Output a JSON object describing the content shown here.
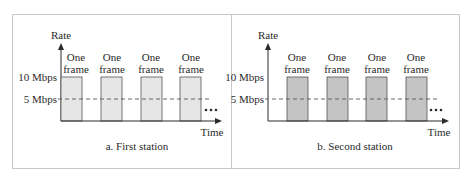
{
  "panels": [
    {
      "id": "first",
      "caption": "a. First station",
      "y_axis_label": "Rate",
      "x_axis_label": "Time",
      "levels": [
        {
          "label": "10 Mbps",
          "value": 10
        },
        {
          "label": "5 Mbps",
          "value": 5
        }
      ],
      "frame_label_line1": "One",
      "frame_label_line2": "frame",
      "frames": 4,
      "bar_fill": "#e6e6e6",
      "continuation": "•••"
    },
    {
      "id": "second",
      "caption": "b. Second station",
      "y_axis_label": "Rate",
      "x_axis_label": "Time",
      "levels": [
        {
          "label": "10 Mbps",
          "value": 10
        },
        {
          "label": "5 Mbps",
          "value": 5
        }
      ],
      "frame_label_line1": "One",
      "frame_label_line2": "frame",
      "frames": 4,
      "bar_fill": "#c4c4c4",
      "continuation": "•••"
    }
  ]
}
